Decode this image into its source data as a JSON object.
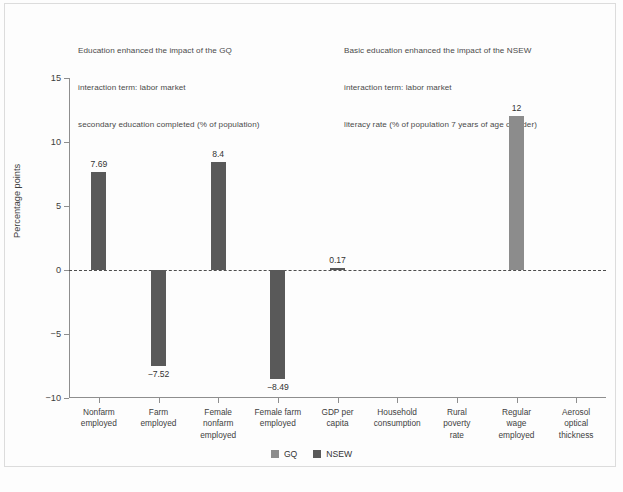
{
  "notes": {
    "left": [
      "Education enhanced the impact of the GQ",
      "interaction term: labor market",
      "secondary education completed (% of population)"
    ],
    "right": [
      "Basic education enhanced the impact of the NSEW",
      "interaction term: labor market",
      "literacy rate (% of population 7 years of age or older)"
    ]
  },
  "colors": {
    "gq": "#8c8c8c",
    "nsew": "#595959",
    "axis": "#8e8e8e",
    "text": "#3d3d3d"
  },
  "legend": [
    {
      "label": "GQ",
      "color": "#8c8c8c"
    },
    {
      "label": "NSEW",
      "color": "#595959"
    }
  ],
  "chart_data": {
    "type": "bar",
    "title": "",
    "xlabel": "",
    "ylabel": "Percentage points",
    "ylim": [
      -10,
      15
    ],
    "yticks": [
      15,
      10,
      5,
      0,
      -5,
      -10
    ],
    "ytick_labels": [
      "15",
      "10",
      "5",
      "0",
      "−5",
      "−10"
    ],
    "grid": false,
    "zero_line": true,
    "legend_position": "bottom-center",
    "categories": [
      "Nonfarm employed",
      "Farm employed",
      "Female nonfarm employed",
      "Female farm employed",
      "GDP per capita",
      "Household consumption",
      "Rural poverty rate",
      "Regular wage employed",
      "Aerosol optical thickness"
    ],
    "category_label_lines": [
      [
        "Nonfarm",
        "employed"
      ],
      [
        "Farm",
        "employed"
      ],
      [
        "Female",
        "nonfarm",
        "employed"
      ],
      [
        "Female farm",
        "employed"
      ],
      [
        "GDP per",
        "capita"
      ],
      [
        "Household",
        "consumption"
      ],
      [
        "Rural",
        "poverty",
        "rate"
      ],
      [
        "Regular",
        "wage",
        "employed"
      ],
      [
        "Aerosol",
        "optical",
        "thickness"
      ]
    ],
    "series": [
      {
        "name": "GQ",
        "color": "#8c8c8c",
        "values": [
          null,
          null,
          null,
          null,
          null,
          null,
          null,
          12,
          null
        ],
        "labels": [
          "",
          "",
          "",
          "",
          "",
          "",
          "",
          "12",
          ""
        ]
      },
      {
        "name": "NSEW",
        "color": "#595959",
        "values": [
          7.69,
          -7.52,
          8.4,
          -8.49,
          0.17,
          null,
          null,
          null,
          null
        ],
        "labels": [
          "7.69",
          "−7.52",
          "8.4",
          "−8.49",
          "0.17",
          "",
          "",
          "",
          ""
        ]
      }
    ]
  }
}
